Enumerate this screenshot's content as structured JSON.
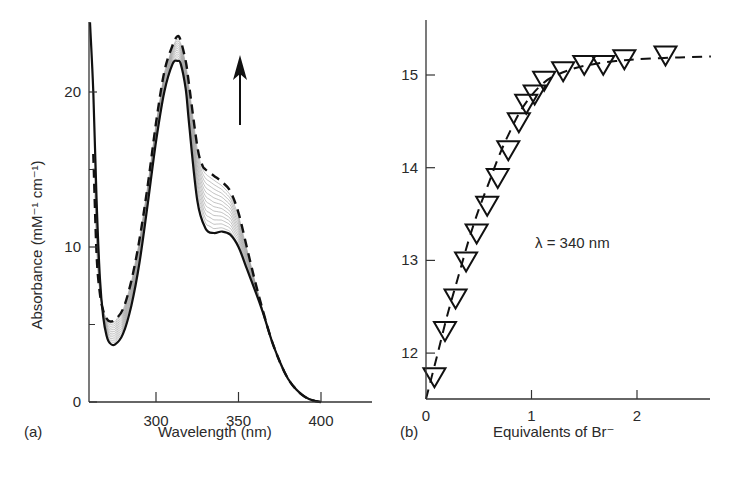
{
  "chart_data": [
    {
      "panel": "(a)",
      "type": "line",
      "title": "",
      "xlabel": "Wavelength (nm)",
      "ylabel": "Absorbance (mM⁻¹ cm⁻¹)",
      "xlim": [
        260,
        430
      ],
      "ylim": [
        0,
        24.5
      ],
      "xticks": [
        300,
        350,
        400
      ],
      "yticks": [
        0,
        10,
        20
      ],
      "yticks_minor": [
        5,
        15
      ],
      "grid": false,
      "annotation": "upward arrow indicating increasing absorbance with Br⁻ addition",
      "series": [
        {
          "name": "initial (0 equiv Br⁻)",
          "style": "solid",
          "x": [
            260,
            262,
            264,
            266,
            268,
            270,
            272,
            275,
            280,
            285,
            290,
            295,
            300,
            305,
            310,
            313,
            315,
            318,
            320,
            325,
            330,
            335,
            340,
            345,
            350,
            355,
            360,
            365,
            370,
            375,
            380,
            385,
            390,
            395,
            400
          ],
          "y": [
            24.5,
            20,
            13,
            8,
            5.5,
            4.3,
            3.8,
            3.7,
            4.4,
            6.2,
            9.0,
            12.8,
            16.8,
            20.0,
            21.8,
            22.0,
            21.8,
            20.2,
            18.0,
            13.0,
            11.2,
            10.9,
            11.0,
            10.8,
            10.0,
            8.6,
            7.2,
            5.7,
            4.0,
            2.6,
            1.5,
            0.8,
            0.35,
            0.1,
            0.0
          ]
        },
        {
          "name": "final (excess Br⁻)",
          "style": "dashed",
          "x": [
            262,
            264,
            266,
            268,
            270,
            272,
            275,
            280,
            285,
            290,
            295,
            300,
            305,
            310,
            313,
            315,
            318,
            320,
            325,
            328,
            330,
            335,
            340,
            345,
            350,
            355,
            360,
            365,
            370,
            375,
            380,
            385,
            390,
            395,
            400
          ],
          "y": [
            16,
            9.5,
            7.0,
            5.9,
            5.4,
            5.2,
            5.3,
            6.0,
            7.8,
            10.5,
            14.0,
            18.0,
            21.3,
            23.0,
            23.6,
            23.3,
            22.0,
            20.5,
            16.5,
            15.3,
            15.0,
            14.6,
            14.2,
            13.6,
            12.2,
            10.0,
            7.8,
            5.8,
            4.0,
            2.6,
            1.5,
            0.8,
            0.35,
            0.1,
            0.0
          ]
        }
      ],
      "intermediate_traces": 12
    },
    {
      "panel": "(b)",
      "type": "scatter",
      "title": "",
      "xlabel": "Equivalents of Br⁻",
      "ylabel": "",
      "xlim": [
        0,
        2.7
      ],
      "ylim": [
        11.5,
        15.6
      ],
      "xticks": [
        0,
        1,
        2
      ],
      "yticks": [
        12,
        13,
        14,
        15
      ],
      "grid": false,
      "annotation": "λ = 340 nm",
      "marker": "inverted-triangle",
      "series": [
        {
          "name": "data",
          "x": [
            0.08,
            0.18,
            0.28,
            0.38,
            0.48,
            0.58,
            0.68,
            0.78,
            0.88,
            0.95,
            1.03,
            1.12,
            1.3,
            1.5,
            1.68,
            1.88,
            2.27
          ],
          "y": [
            11.75,
            12.25,
            12.6,
            13.0,
            13.3,
            13.6,
            13.9,
            14.2,
            14.5,
            14.7,
            14.8,
            14.95,
            15.05,
            15.12,
            15.12,
            15.18,
            15.22
          ]
        },
        {
          "name": "fit",
          "style": "dashed",
          "x": [
            0,
            0.1,
            0.2,
            0.3,
            0.4,
            0.5,
            0.6,
            0.7,
            0.8,
            0.9,
            1.0,
            1.1,
            1.2,
            1.4,
            1.6,
            1.8,
            2.0,
            2.4,
            2.7
          ],
          "y": [
            11.5,
            11.95,
            12.4,
            12.8,
            13.2,
            13.55,
            13.85,
            14.15,
            14.4,
            14.62,
            14.78,
            14.9,
            14.98,
            15.07,
            15.12,
            15.15,
            15.17,
            15.19,
            15.2
          ]
        }
      ]
    }
  ],
  "labels": {
    "panel_a": "(a)",
    "panel_b": "(b)",
    "a_xlabel": "Wavelength (nm)",
    "a_ylabel": "Absorbance (mM⁻¹ cm⁻¹)",
    "b_xlabel": "Equivalents of Br⁻",
    "b_annotation": "λ = 340 nm"
  }
}
